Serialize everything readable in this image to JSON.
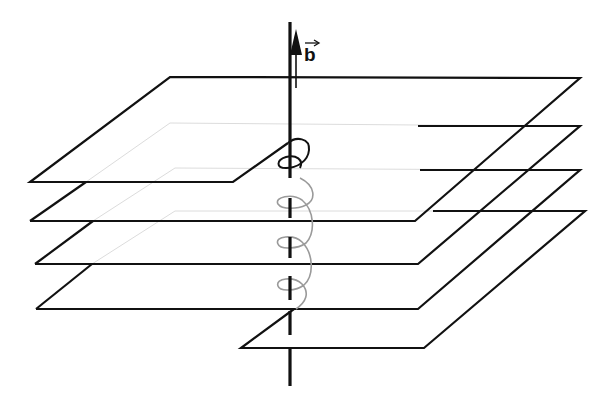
{
  "diagram": {
    "title": "Screw dislocation with Burgers vector along the dislocation line",
    "vector_label": "b",
    "vector_overarrow": "→",
    "colors": {
      "line": "#111111",
      "hidden_line": "#d8d8d8",
      "helix_front": "#111111",
      "helix_back": "#9a9a9a",
      "background": "#ffffff"
    },
    "planes": [
      {
        "name": "plane-1",
        "level": 1
      },
      {
        "name": "plane-2",
        "level": 2
      },
      {
        "name": "plane-3",
        "level": 3
      },
      {
        "name": "plane-4",
        "level": 4
      }
    ],
    "elements": {
      "dislocation_line": "dislocation line (vertical axis)",
      "burgers_vector": "Burgers vector b",
      "helix": "helical path around dislocation"
    }
  }
}
